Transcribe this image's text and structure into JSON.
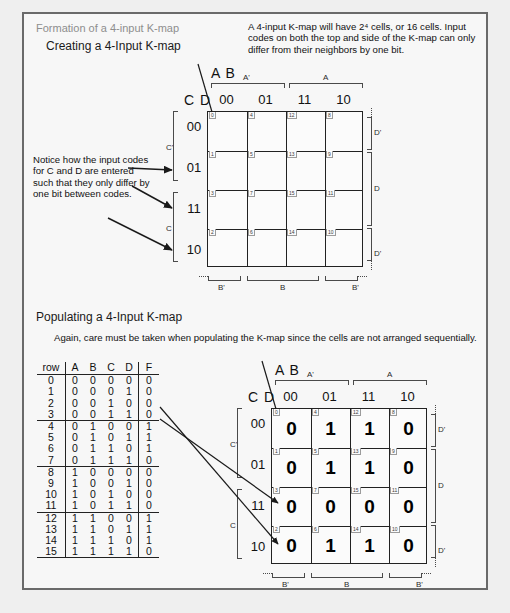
{
  "header": {
    "slide_title_gray": "Formation of a 4-input K-map",
    "slide_title_black": "Creating a 4-Input K-map",
    "intro_paragraph": "A 4-input K-map will have 2⁴ cells, or 16 cells.  Input codes on both the top and side of the K-map can only differ from their neighbors by one bit."
  },
  "section2": {
    "title": "Populating a 4-Input K-map",
    "paragraph": "Again, care must be taken when populating the K-map since the cells are not arranged sequentially."
  },
  "annotation": {
    "notice_text": "Notice how the input codes for C and D are entered such that they only differ by one bit between codes."
  },
  "kmap_common": {
    "top_var_label": "A B",
    "side_var_label": "C D",
    "col_headers": [
      "00",
      "01",
      "11",
      "10"
    ],
    "row_headers": [
      "00",
      "01",
      "11",
      "10"
    ],
    "top_groups": [
      {
        "label": "A'",
        "cols": [
          0,
          1
        ]
      },
      {
        "label": "A",
        "cols": [
          2,
          3
        ]
      }
    ],
    "bottom_groups": [
      {
        "label": "B'",
        "cols": [
          0
        ]
      },
      {
        "label": "B",
        "cols": [
          1,
          2
        ]
      },
      {
        "label": "B'",
        "cols": [
          3
        ]
      }
    ],
    "left_groups": [
      {
        "label": "C'",
        "rows": [
          0,
          1
        ]
      },
      {
        "label": "C",
        "rows": [
          2,
          3
        ]
      }
    ],
    "right_groups": [
      {
        "label": "D'",
        "rows": [
          0
        ]
      },
      {
        "label": "D",
        "rows": [
          1,
          2
        ]
      },
      {
        "label": "D'",
        "rows": [
          3
        ]
      }
    ],
    "cell_indices": [
      [
        "0",
        "4",
        "12",
        "8"
      ],
      [
        "1",
        "5",
        "13",
        "9"
      ],
      [
        "3",
        "7",
        "15",
        "11"
      ],
      [
        "2",
        "6",
        "14",
        "10"
      ]
    ]
  },
  "kmap_top": {
    "values": [
      [
        "",
        "",
        "",
        ""
      ],
      [
        "",
        "",
        "",
        ""
      ],
      [
        "",
        "",
        "",
        ""
      ],
      [
        "",
        "",
        "",
        ""
      ]
    ]
  },
  "kmap_bottom": {
    "values": [
      [
        "0",
        "1",
        "1",
        "0"
      ],
      [
        "0",
        "1",
        "1",
        "0"
      ],
      [
        "0",
        "0",
        "0",
        "0"
      ],
      [
        "0",
        "1",
        "1",
        "0"
      ]
    ]
  },
  "chart_data": {
    "type": "table",
    "columns": [
      "row",
      "A",
      "B",
      "C",
      "D",
      "F"
    ],
    "rows": [
      [
        "0",
        "0",
        "0",
        "0",
        "0",
        "0"
      ],
      [
        "1",
        "0",
        "0",
        "0",
        "1",
        "0"
      ],
      [
        "2",
        "0",
        "0",
        "1",
        "0",
        "0"
      ],
      [
        "3",
        "0",
        "0",
        "1",
        "1",
        "0"
      ],
      [
        "4",
        "0",
        "1",
        "0",
        "0",
        "1"
      ],
      [
        "5",
        "0",
        "1",
        "0",
        "1",
        "1"
      ],
      [
        "6",
        "0",
        "1",
        "1",
        "0",
        "1"
      ],
      [
        "7",
        "0",
        "1",
        "1",
        "1",
        "0"
      ],
      [
        "8",
        "1",
        "0",
        "0",
        "0",
        "0"
      ],
      [
        "9",
        "1",
        "0",
        "0",
        "1",
        "0"
      ],
      [
        "10",
        "1",
        "0",
        "1",
        "0",
        "0"
      ],
      [
        "11",
        "1",
        "0",
        "1",
        "1",
        "0"
      ],
      [
        "12",
        "1",
        "1",
        "0",
        "0",
        "1"
      ],
      [
        "13",
        "1",
        "1",
        "0",
        "1",
        "1"
      ],
      [
        "14",
        "1",
        "1",
        "1",
        "0",
        "1"
      ],
      [
        "15",
        "1",
        "1",
        "1",
        "1",
        "0"
      ]
    ],
    "group_breaks_after_rows": [
      3,
      7,
      11,
      15
    ]
  }
}
